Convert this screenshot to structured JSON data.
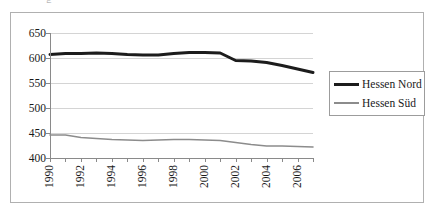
{
  "figure": {
    "clipped_header_glyph": "g",
    "background_color": "#ffffff",
    "frame_color": "#b0b0b0"
  },
  "legend": {
    "position": "right",
    "items": [
      {
        "label": "Hessen Nord",
        "color": "#1c1c1c",
        "style": "thick"
      },
      {
        "label": "Hessen Süd",
        "color": "#8c8c8c",
        "style": "thin"
      }
    ]
  },
  "axes": {
    "y_ticks": [
      "400",
      "450",
      "500",
      "550",
      "600",
      "650"
    ],
    "x_ticks": [
      "1990",
      "1992",
      "1994",
      "1996",
      "1998",
      "2000",
      "2002",
      "2004",
      "2006"
    ]
  },
  "chart_data": {
    "type": "line",
    "title": "",
    "subtitle": "",
    "xlabel": "",
    "ylabel": "",
    "xlim": [
      1990,
      2007
    ],
    "ylim": [
      400,
      650
    ],
    "y_ticks": [
      400,
      450,
      500,
      550,
      600,
      650
    ],
    "x_ticks_labeled": [
      1990,
      1992,
      1994,
      1996,
      1998,
      2000,
      2002,
      2004,
      2006
    ],
    "grid": true,
    "grid_axis": "y",
    "legend_position": "right",
    "x": [
      1990,
      1991,
      1992,
      1993,
      1994,
      1995,
      1996,
      1997,
      1998,
      1999,
      2000,
      2001,
      2002,
      2003,
      2004,
      2005,
      2006,
      2007
    ],
    "series": [
      {
        "name": "Hessen Nord",
        "color": "#1c1c1c",
        "line_width": 3,
        "values": [
          607,
          609,
          609,
          610,
          609,
          607,
          606,
          606,
          609,
          611,
          611,
          610,
          595,
          594,
          591,
          585,
          578,
          571
        ]
      },
      {
        "name": "Hessen Süd",
        "color": "#8c8c8c",
        "line_width": 1.6,
        "values": [
          446,
          446,
          441,
          439,
          437,
          436,
          435,
          436,
          437,
          437,
          436,
          435,
          431,
          427,
          424,
          424,
          423,
          422
        ]
      }
    ]
  }
}
